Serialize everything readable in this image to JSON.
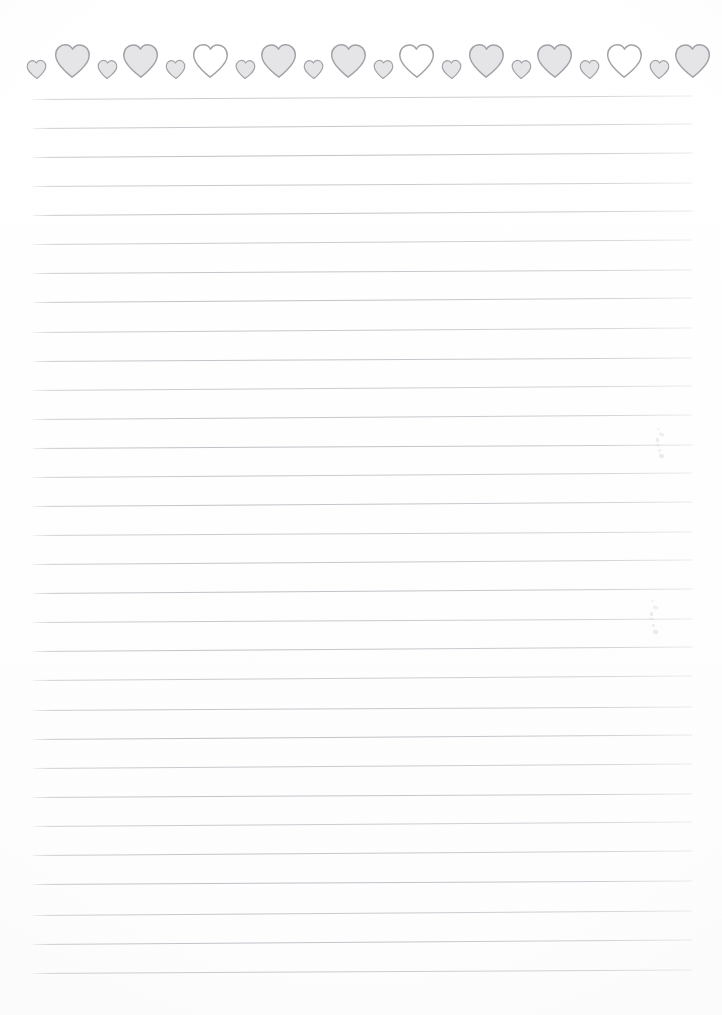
{
  "document": {
    "kind": "scanned-lined-stationery",
    "title": "Heart Border Lined Paper",
    "page_width": 722,
    "page_height": 1015,
    "background_color": "#ffffff",
    "text_content": ""
  },
  "border": {
    "name": "heart-border",
    "position": "top",
    "motif": "heart",
    "heart_count": 22,
    "pattern": "alternating small and large hearts",
    "outline_color": "#9a9a9f",
    "fill_light": "#ffffff",
    "fill_gray": "#e3e3e6",
    "row_left": 25,
    "row_right": 702,
    "row_top": 43,
    "row_bottom": 82,
    "hearts": [
      {
        "index": 1,
        "size": "small",
        "fill": "gray",
        "x": 25,
        "w": 24,
        "h": 21,
        "rot": -2
      },
      {
        "index": 2,
        "size": "large",
        "fill": "gray",
        "x": 51,
        "w": 42,
        "h": 38,
        "rot": 1
      },
      {
        "index": 3,
        "size": "small",
        "fill": "gray",
        "x": 95,
        "w": 24,
        "h": 21,
        "rot": 2
      },
      {
        "index": 4,
        "size": "large",
        "fill": "gray",
        "x": 120,
        "w": 42,
        "h": 38,
        "rot": -1
      },
      {
        "index": 5,
        "size": "small",
        "fill": "gray",
        "x": 164,
        "w": 24,
        "h": 21,
        "rot": -2
      },
      {
        "index": 6,
        "size": "large",
        "fill": "white",
        "x": 189,
        "w": 42,
        "h": 38,
        "rot": 1
      },
      {
        "index": 7,
        "size": "small",
        "fill": "gray",
        "x": 233,
        "w": 24,
        "h": 21,
        "rot": 2
      },
      {
        "index": 8,
        "size": "large",
        "fill": "gray",
        "x": 258,
        "w": 42,
        "h": 38,
        "rot": -1
      },
      {
        "index": 9,
        "size": "small",
        "fill": "gray",
        "x": 302,
        "w": 24,
        "h": 21,
        "rot": -2
      },
      {
        "index": 10,
        "size": "large",
        "fill": "gray",
        "x": 327,
        "w": 42,
        "h": 38,
        "rot": 1
      },
      {
        "index": 11,
        "size": "small",
        "fill": "gray",
        "x": 371,
        "w": 24,
        "h": 21,
        "rot": 2
      },
      {
        "index": 12,
        "size": "large",
        "fill": "white",
        "x": 396,
        "w": 42,
        "h": 38,
        "rot": -1
      },
      {
        "index": 13,
        "size": "small",
        "fill": "gray",
        "x": 440,
        "w": 24,
        "h": 21,
        "rot": -2
      },
      {
        "index": 14,
        "size": "large",
        "fill": "gray",
        "x": 465,
        "w": 42,
        "h": 38,
        "rot": 1
      },
      {
        "index": 15,
        "size": "small",
        "fill": "gray",
        "x": 509,
        "w": 24,
        "h": 21,
        "rot": 2
      },
      {
        "index": 16,
        "size": "large",
        "fill": "gray",
        "x": 534,
        "w": 42,
        "h": 38,
        "rot": -1
      },
      {
        "index": 17,
        "size": "small",
        "fill": "gray",
        "x": 578,
        "w": 24,
        "h": 21,
        "rot": -2
      },
      {
        "index": 18,
        "size": "large",
        "fill": "white",
        "x": 603,
        "w": 42,
        "h": 38,
        "rot": 1
      },
      {
        "index": 19,
        "size": "small",
        "fill": "gray",
        "x": 647,
        "w": 24,
        "h": 21,
        "rot": 2
      },
      {
        "index": 20,
        "size": "large",
        "fill": "gray",
        "x": 672,
        "w": 42,
        "h": 38,
        "rot": -1
      },
      {
        "index": 21,
        "size": "small",
        "fill": "gray",
        "x": 716,
        "w": 24,
        "h": 21,
        "rot": 0
      },
      {
        "index": 22,
        "size": "small",
        "fill": "gray",
        "x": 740,
        "w": 24,
        "h": 21,
        "rot": 0
      }
    ]
  },
  "ruled_lines": {
    "name": "ruled-lines",
    "count": 30,
    "left": 33,
    "right": 692,
    "width": 659,
    "first_y": 99,
    "spacing": 29.1,
    "color": "#c3c3ca",
    "thickness": 1,
    "skew_degrees": -0.35,
    "y_positions": [
      99,
      128,
      157,
      186,
      215,
      244,
      273,
      302,
      332,
      361,
      390,
      419,
      448,
      477,
      506,
      535,
      564,
      593,
      622,
      651,
      680,
      710,
      739,
      768,
      797,
      826,
      855,
      884,
      915,
      944,
      973
    ]
  },
  "marks": {
    "name": "pencil-smudges",
    "description": "two faint vertical pencil marks in the right margin",
    "items": [
      {
        "id": "smudge-upper",
        "x": 655,
        "y": 428,
        "w": 8,
        "h": 30
      },
      {
        "id": "smudge-lower",
        "x": 649,
        "y": 600,
        "w": 10,
        "h": 34
      }
    ]
  }
}
